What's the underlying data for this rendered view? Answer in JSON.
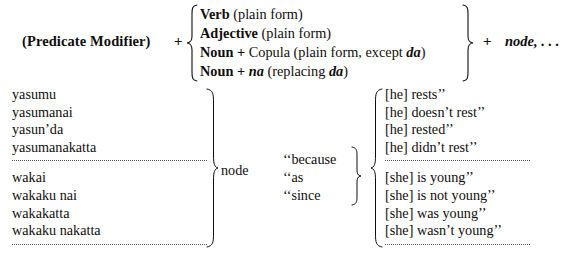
{
  "formula": {
    "predicate_modifier": "(Predicate Modifier)",
    "plus_1": "+",
    "alternatives": [
      "Verb (plain form)",
      "Adjective (plain form)",
      "Noun + Copula (plain form, except da)",
      "Noun + na (replacing da)"
    ],
    "alt_1_head": "Verb",
    "alt_1_tail": "(plain form)",
    "alt_2_head": "Adjective",
    "alt_2_tail": "(plain form)",
    "alt_3_head": "Noun",
    "alt_3_plus": "+",
    "alt_3_mid": "Copula",
    "alt_3_tail": "(plain form, except",
    "alt_3_ital": "da",
    "alt_3_close": ")",
    "alt_4_head": "Noun",
    "alt_4_plus": "+",
    "alt_4_ital": "na",
    "alt_4_tail": "(replacing",
    "alt_4_ital2": "da",
    "alt_4_close": ")",
    "plus_2": "+",
    "node_trailer": "node, . . ."
  },
  "table": {
    "japanese_group_1": [
      "yasumu",
      "yasumanai",
      "yasun’da",
      "yasumanakatta"
    ],
    "japanese_group_2": [
      "wakai",
      "wakaku nai",
      "wakakatta",
      "wakaku nakatta"
    ],
    "node_label": "node",
    "conjunctions": [
      "‘‘because",
      "‘‘as",
      "‘‘since"
    ],
    "english_group_1": [
      "[he] rests’’",
      "[he] doesn’t rest’’",
      "[he] rested’’",
      "[he] didn’t rest’’"
    ],
    "english_group_2": [
      "[she] is young’’",
      "[she] is not young’’",
      "[she] was young’’",
      "[she] wasn’t young’’"
    ]
  },
  "colors": {
    "ink": "#100d0c",
    "rule": "#59524e",
    "background": "#ffffff"
  }
}
